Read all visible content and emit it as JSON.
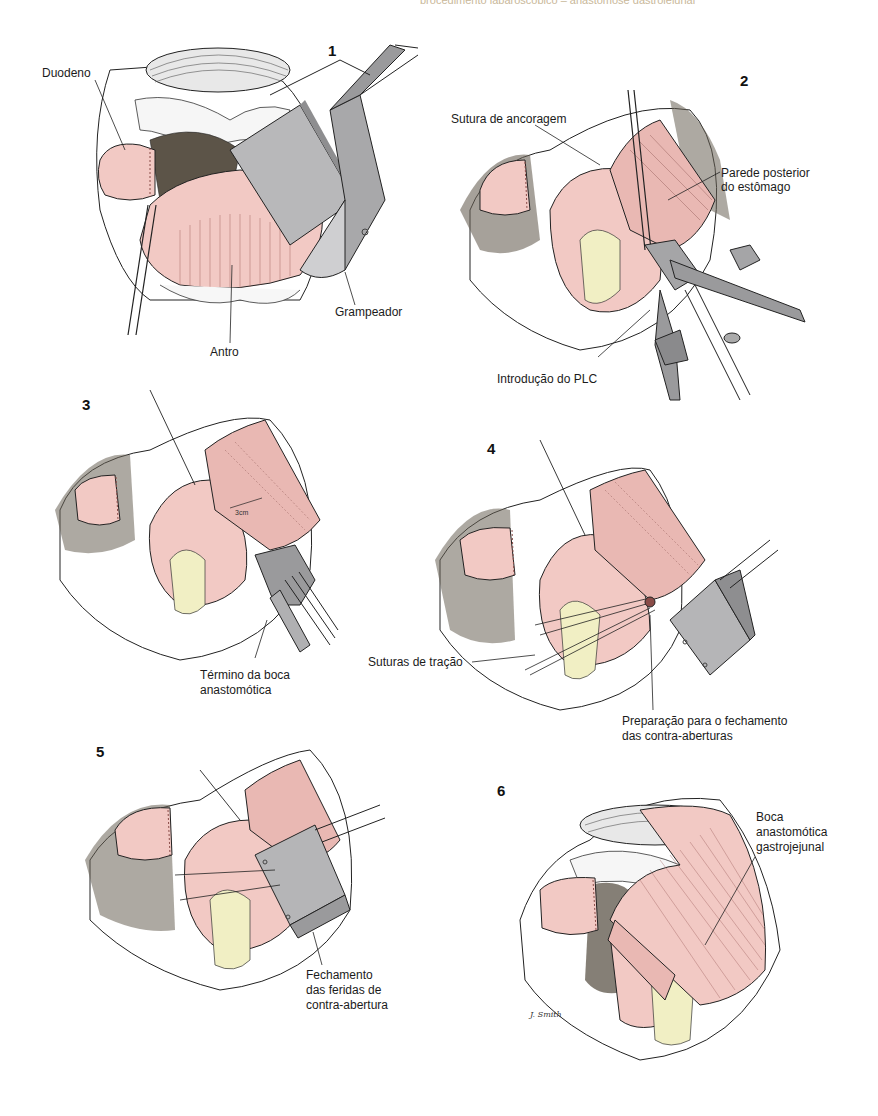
{
  "header": {
    "running_text": "procedimento laparoscópico – anastomose gastrojejunal"
  },
  "colors": {
    "tissue_pink": "#f2c9c4",
    "tissue_pink_dark": "#d9a19c",
    "instrument_gray": "#9a9a9c",
    "instrument_gray_light": "#cfcfd1",
    "mesentery_yellow": "#f1efc4",
    "dark_tissue": "#5c5448",
    "line": "#222222"
  },
  "figure": {
    "panels": [
      {
        "number": "1",
        "labels": [
          "Duodeno",
          "Grampeador",
          "Antro"
        ]
      },
      {
        "number": "2",
        "labels": [
          "Sutura de ancoragem",
          "Parede posterior",
          "do estômago",
          "Introdução do PLC"
        ]
      },
      {
        "number": "3",
        "labels": [
          "Término da boca",
          "anastomótica"
        ],
        "measure": "3cm"
      },
      {
        "number": "4",
        "labels": [
          "Suturas de tração",
          "Preparação para o fechamento",
          "das contra-aberturas"
        ]
      },
      {
        "number": "5",
        "labels": [
          "Fechamento",
          "das feridas de",
          "contra-abertura"
        ]
      },
      {
        "number": "6",
        "labels": [
          "Boca",
          "anastomótica",
          "gastrojejunal"
        ],
        "signature": "J. Smith"
      }
    ]
  }
}
